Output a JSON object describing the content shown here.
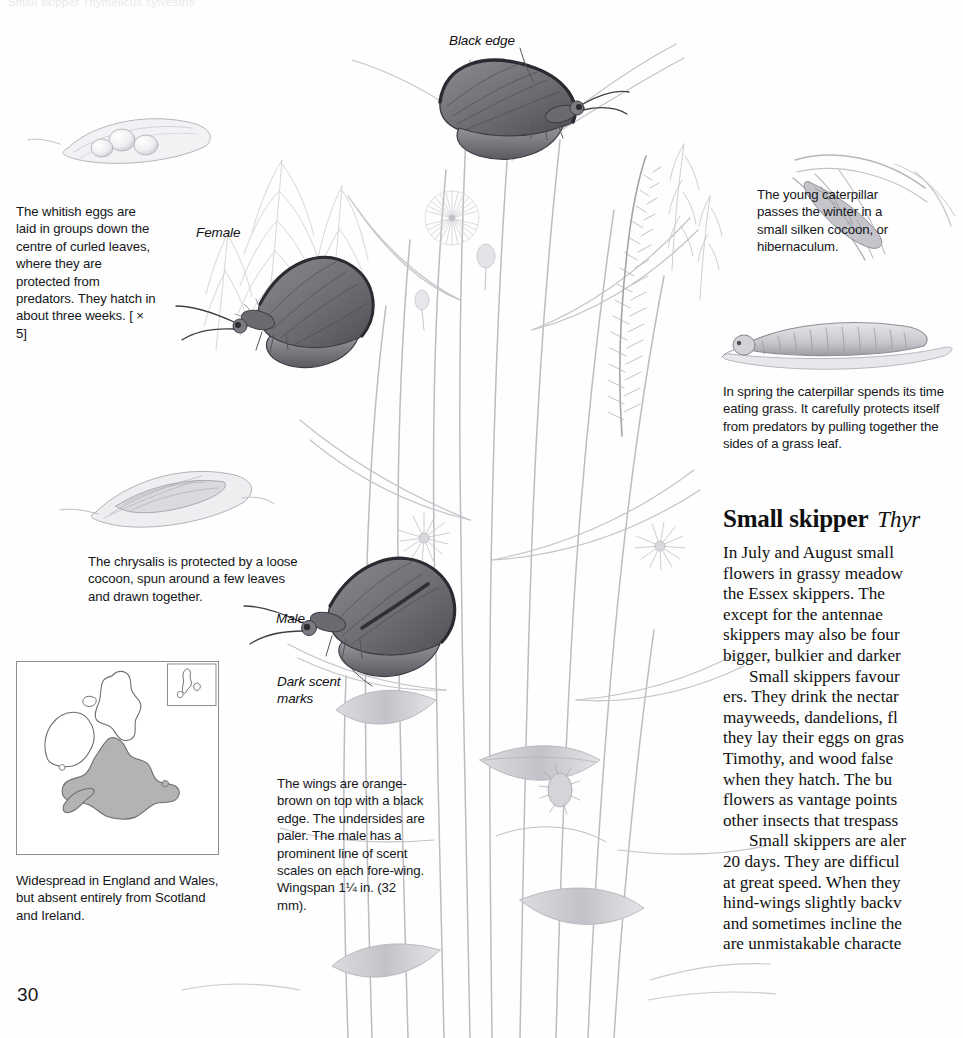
{
  "page": {
    "number": "30",
    "running_head": "Small skipper Thymelicus sylvestris"
  },
  "article": {
    "title": "Small skipper",
    "scientific_name": "Thyr",
    "paragraphs": [
      {
        "indent": false,
        "lines": [
          "In July and August small",
          "flowers in grassy meadow",
          "the Essex skippers. The",
          "except for the antennae",
          "skippers may also be four",
          "bigger, bulkier and darker"
        ]
      },
      {
        "indent": true,
        "lines": [
          "Small skippers favour",
          "ers. They drink the nectar",
          "mayweeds, dandelions, fl",
          "they lay their eggs on gras",
          "Timothy, and wood false",
          "when they hatch. The bu",
          "flowers as vantage points",
          "other insects that trespass"
        ]
      },
      {
        "indent": true,
        "lines": [
          "Small skippers are aler",
          "20 days. They are difficul",
          "at great speed. When they",
          "hind-wings slightly backv",
          "and sometimes incline the",
          "are unmistakable characte"
        ]
      }
    ]
  },
  "captions": {
    "eggs": "The whitish eggs are laid in groups down the centre of curled leaves, where they are protected from predators. They hatch in about three weeks. [ × 5]",
    "chrysalis": "The chrysalis is protected by a loose cocoon, spun around a few leaves and drawn together.",
    "wings": "The wings are orange-brown on top with a black edge. The undersides are paler. The male has a prominent line of scent scales on each fore-wing. Wingspan 1¼ in. (32 mm).",
    "hibernaculum": "The young caterpillar passes the winter in a small silken cocoon, or hibernaculum.",
    "spring": "In spring the caterpillar spends its time eating grass. It carefully protects itself from predators by pulling together the sides of a grass leaf.",
    "map": "Widespread in England and Wales, but absent entirely from Scotland and Ireland."
  },
  "figure_labels": {
    "black_edge": "Black edge",
    "female": "Female",
    "male": "Male",
    "dark_scent_marks": "Dark scent\nmarks"
  },
  "colors": {
    "ink": "#15161a",
    "pencil_light": "#c9c9cd",
    "pencil_mid": "#9a9aa0",
    "pencil_dark": "#5f6066",
    "wing": "#6e6f75",
    "map_land_fill": "#b3b3b3",
    "map_outline": "#6d6d6d",
    "map_border": "#8d8d8d"
  }
}
